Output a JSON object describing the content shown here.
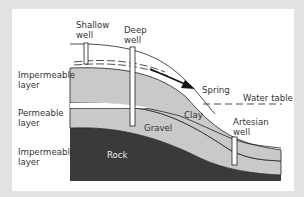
{
  "diagram": {
    "type": "groundwater cross-section",
    "labels": {
      "shallow_well": "Shallow\nwell",
      "deep_well": "Deep\nwell",
      "impermeable_top": "Impermeable\nlayer",
      "permeable": "Permeable\nlayer",
      "impermeable_bottom": "Impermeable\nlayer",
      "spring": "Spring",
      "water_table": "Water table",
      "clay": "Clay",
      "gravel": "Gravel",
      "rock": "Rock",
      "artesian_well": "Artesian\nwell"
    },
    "colors": {
      "background": "#e2e2e2",
      "panel": "#ffffff",
      "clay_fill": "#c8c8c8",
      "gravel_fill": "#c8c8c8",
      "rock_fill": "#3a3a3a",
      "line": "#222222"
    }
  }
}
